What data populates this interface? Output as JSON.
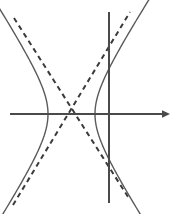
{
  "figure": {
    "width": 175,
    "height": 214,
    "background_color": "#ffffff"
  },
  "chart_data": {
    "type": "line",
    "title": "",
    "subtitle": "",
    "xlabel": "",
    "ylabel": "",
    "grid": false,
    "legend": null,
    "axis_color": "#4a4a4a",
    "curve_color": "#5a5a5a",
    "asymptote_color": "#3a3a3a",
    "vertical_line_color": "#4a4a4a",
    "center": {
      "x": 71.5,
      "y": 114
    },
    "semi_transverse_axis_a": 23.5,
    "asymptote_slope": 1.55,
    "xlim": [
      -71.5,
      103.5
    ],
    "ylim": [
      -100,
      114
    ],
    "elements": [
      {
        "name": "x-axis",
        "kind": "axis",
        "orientation": "horizontal",
        "y": 114,
        "x_start": 10,
        "x_end": 170,
        "arrow_end": "right",
        "style": "solid"
      },
      {
        "name": "vertical-line",
        "kind": "line",
        "orientation": "vertical",
        "x": 109,
        "y_start": 12,
        "y_end": 203,
        "arrow_end": "none",
        "style": "solid"
      },
      {
        "name": "hyperbola-left-branch",
        "kind": "curve",
        "style": "solid",
        "vertex": {
          "x": 48,
          "y": 114
        },
        "opens": "left"
      },
      {
        "name": "hyperbola-right-branch",
        "kind": "curve",
        "style": "solid",
        "vertex": {
          "x": 95,
          "y": 114
        },
        "opens": "right"
      },
      {
        "name": "asymptote-negative-slope",
        "kind": "line",
        "style": "dashed",
        "from": {
          "x": 14,
          "y": 18
        },
        "to": {
          "x": 130,
          "y": 200
        }
      },
      {
        "name": "asymptote-positive-slope",
        "kind": "line",
        "style": "dashed",
        "from": {
          "x": 13,
          "y": 205
        },
        "to": {
          "x": 130,
          "y": 12
        }
      }
    ],
    "series": [
      {
        "name": "hyperbola-left-branch",
        "style": "solid",
        "x": [
          -58.5,
          -49.0,
          -40.0,
          -32.0,
          -26.0,
          -23.5,
          -26.0,
          -32.0,
          -40.0,
          -49.0,
          -58.5
        ],
        "y": [
          85.0,
          69.0,
          52.0,
          34.0,
          16.0,
          0.0,
          -16.0,
          -34.0,
          -52.0,
          -69.0,
          -85.0
        ]
      },
      {
        "name": "hyperbola-right-branch",
        "style": "solid",
        "x": [
          58.5,
          49.0,
          40.0,
          32.0,
          26.0,
          23.5,
          26.0,
          32.0,
          40.0,
          49.0,
          58.5
        ],
        "y": [
          85.0,
          69.0,
          52.0,
          34.0,
          16.0,
          0.0,
          -16.0,
          -34.0,
          -52.0,
          -69.0,
          -85.0
        ]
      },
      {
        "name": "asymptote-positive-slope",
        "style": "dashed",
        "x": [
          -58.5,
          58.5
        ],
        "y": [
          -90.7,
          90.7
        ]
      },
      {
        "name": "asymptote-negative-slope",
        "style": "dashed",
        "x": [
          -58.5,
          58.5
        ],
        "y": [
          90.7,
          -90.7
        ]
      },
      {
        "name": "vertical-line",
        "style": "solid",
        "x": [
          37.5,
          37.5
        ],
        "y": [
          102,
          -89
        ]
      }
    ]
  }
}
